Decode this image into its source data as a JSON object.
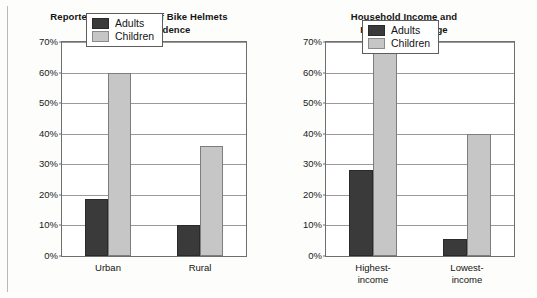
{
  "page": {
    "background_color": "#fdfdfb",
    "edge_line_color": "#b9b9b9"
  },
  "colors": {
    "adults": "#3a3a3a",
    "children": "#c6c6c6",
    "gridline": "#9a9a9a",
    "axis": "#6e6e6e",
    "text": "#141414"
  },
  "legend": {
    "adults_label": "Adults",
    "children_label": "Children"
  },
  "charts": [
    {
      "id": "bike-helmets-by-age-and-residence",
      "title": "Reported Regular Use of Bike Helmets\nby Age and Residence",
      "yticks": [
        "0%",
        "10%",
        "20%",
        "30%",
        "40%",
        "50%",
        "60%",
        "70%"
      ],
      "categories": [
        "Urban",
        "Rural"
      ]
    },
    {
      "id": "household-income-and-helmet-use-by-age",
      "title": "Household Income and\nHelmet Use by Age",
      "yticks": [
        "0%",
        "10%",
        "20%",
        "30%",
        "40%",
        "50%",
        "60%",
        "70%"
      ],
      "categories": [
        "Highest-\nincome",
        "Lowest-\nincome"
      ]
    }
  ],
  "chart_data": [
    {
      "type": "bar",
      "title": "Reported Regular Use of Bike Helmets by Age and Residence",
      "xlabel": "",
      "ylabel": "",
      "ylim": [
        0,
        70
      ],
      "ytick_values": [
        0,
        10,
        20,
        30,
        40,
        50,
        60,
        70
      ],
      "ytick_labels": [
        "0%",
        "10%",
        "20%",
        "30%",
        "40%",
        "50%",
        "60%",
        "70%"
      ],
      "categories": [
        "Urban",
        "Rural"
      ],
      "grid": true,
      "legend_position": "top-center",
      "series": [
        {
          "name": "Adults",
          "color": "#3a3a3a",
          "values": [
            18.5,
            10.0
          ]
        },
        {
          "name": "Children",
          "color": "#c6c6c6",
          "values": [
            60.0,
            36.0
          ]
        }
      ]
    },
    {
      "type": "bar",
      "title": "Household Income and Helmet Use by Age",
      "xlabel": "",
      "ylabel": "",
      "ylim": [
        0,
        70
      ],
      "ytick_values": [
        0,
        10,
        20,
        30,
        40,
        50,
        60,
        70
      ],
      "ytick_labels": [
        "0%",
        "10%",
        "20%",
        "30%",
        "40%",
        "50%",
        "60%",
        "70%"
      ],
      "categories": [
        "Highest-income",
        "Lowest-income"
      ],
      "grid": true,
      "legend_position": "top-center",
      "series": [
        {
          "name": "Adults",
          "color": "#3a3a3a",
          "values": [
            28.0,
            5.5
          ]
        },
        {
          "name": "Children",
          "color": "#c6c6c6",
          "values": [
            69.0,
            40.0
          ]
        }
      ]
    }
  ]
}
